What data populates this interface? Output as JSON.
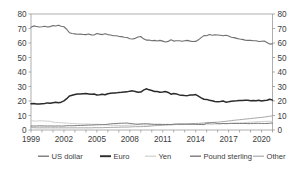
{
  "chart_data": {
    "type": "line",
    "title": "",
    "subtitle": "",
    "xlabel": "",
    "ylabel": "",
    "ylim": [
      0,
      80
    ],
    "yticks": [
      0,
      10,
      20,
      30,
      40,
      50,
      60,
      70,
      80
    ],
    "y2ticks": [
      0,
      10,
      20,
      30,
      40,
      50,
      60,
      70,
      80
    ],
    "xlim": [
      1999,
      2021
    ],
    "xticks": [
      1999,
      2002,
      2005,
      2008,
      2011,
      2014,
      2017,
      2020
    ],
    "xtick_labels": [
      "1999",
      "2002",
      "2005",
      "2008",
      "2011",
      "2014",
      "2017",
      "2020"
    ],
    "grid": false,
    "legend_position": "bottom",
    "dual_axis": true,
    "x": [
      1999.0,
      1999.25,
      1999.5,
      1999.75,
      2000.0,
      2000.25,
      2000.5,
      2000.75,
      2001.0,
      2001.25,
      2001.5,
      2001.75,
      2002.0,
      2002.25,
      2002.5,
      2002.75,
      2003.0,
      2003.25,
      2003.5,
      2003.75,
      2004.0,
      2004.25,
      2004.5,
      2004.75,
      2005.0,
      2005.25,
      2005.5,
      2005.75,
      2006.0,
      2006.25,
      2006.5,
      2006.75,
      2007.0,
      2007.25,
      2007.5,
      2007.75,
      2008.0,
      2008.25,
      2008.5,
      2008.75,
      2009.0,
      2009.25,
      2009.5,
      2009.75,
      2010.0,
      2010.25,
      2010.5,
      2010.75,
      2011.0,
      2011.25,
      2011.5,
      2011.75,
      2012.0,
      2012.25,
      2012.5,
      2012.75,
      2013.0,
      2013.25,
      2013.5,
      2013.75,
      2014.0,
      2014.25,
      2014.5,
      2014.75,
      2015.0,
      2015.25,
      2015.5,
      2015.75,
      2016.0,
      2016.25,
      2016.5,
      2016.75,
      2017.0,
      2017.25,
      2017.5,
      2017.75,
      2018.0,
      2018.25,
      2018.5,
      2018.75,
      2019.0,
      2019.25,
      2019.5,
      2019.75,
      2020.0,
      2020.25,
      2020.5,
      2020.75,
      2021.0
    ],
    "series": [
      {
        "name": "US dollar",
        "color": "#6f6f6f",
        "width": 1.1,
        "values": [
          70.9,
          71.8,
          71.4,
          71.0,
          71.2,
          71.6,
          71.1,
          71.3,
          72.0,
          71.7,
          72.3,
          71.5,
          71.2,
          69.5,
          67.1,
          66.5,
          66.3,
          66.0,
          66.1,
          65.9,
          65.8,
          66.2,
          65.6,
          65.5,
          66.5,
          66.1,
          65.8,
          66.4,
          65.8,
          65.5,
          65.0,
          65.0,
          64.6,
          64.4,
          64.0,
          63.8,
          62.9,
          62.8,
          63.2,
          64.1,
          64.5,
          62.9,
          62.0,
          62.1,
          61.5,
          61.8,
          61.4,
          61.8,
          61.3,
          60.7,
          61.1,
          62.2,
          61.3,
          61.5,
          61.6,
          61.2,
          61.5,
          61.8,
          61.3,
          61.0,
          61.1,
          62.2,
          63.7,
          65.1,
          65.0,
          65.8,
          65.3,
          65.7,
          65.5,
          65.3,
          65.0,
          65.4,
          64.8,
          64.0,
          63.7,
          63.2,
          62.8,
          62.5,
          62.0,
          61.8,
          61.8,
          61.6,
          61.5,
          61.0,
          61.2,
          61.4,
          60.4,
          59.2,
          59.5
        ]
      },
      {
        "name": "Euro",
        "color": "#2b2b2b",
        "width": 1.5,
        "values": [
          18.1,
          18.3,
          18.0,
          17.9,
          18.1,
          18.3,
          18.7,
          18.4,
          18.8,
          19.1,
          18.8,
          19.2,
          20.1,
          21.6,
          23.5,
          24.0,
          24.5,
          24.9,
          24.8,
          25.0,
          25.1,
          24.9,
          24.6,
          24.8,
          24.1,
          24.3,
          24.7,
          24.3,
          25.0,
          25.3,
          25.5,
          25.6,
          25.9,
          26.0,
          26.2,
          26.3,
          26.8,
          27.0,
          26.5,
          26.0,
          26.2,
          27.5,
          28.4,
          27.7,
          27.2,
          26.6,
          26.5,
          26.0,
          26.2,
          26.5,
          25.9,
          24.7,
          25.1,
          24.9,
          24.2,
          24.0,
          23.8,
          23.7,
          24.1,
          24.2,
          24.4,
          23.3,
          22.2,
          21.2,
          21.1,
          20.5,
          20.2,
          19.7,
          19.5,
          19.7,
          20.0,
          19.2,
          19.5,
          19.9,
          20.0,
          20.1,
          20.4,
          20.3,
          20.5,
          20.5,
          20.2,
          20.3,
          20.1,
          20.5,
          20.0,
          20.3,
          20.5,
          21.2,
          20.6
        ]
      },
      {
        "name": "Yen",
        "color": "#cfcfcf",
        "width": 1.0,
        "values": [
          6.4,
          6.3,
          6.1,
          6.4,
          6.3,
          6.2,
          6.1,
          6.0,
          5.5,
          5.2,
          5.1,
          5.0,
          4.9,
          4.8,
          4.6,
          4.5,
          4.4,
          4.3,
          4.2,
          4.1,
          4.2,
          4.1,
          4.0,
          3.9,
          4.0,
          3.9,
          3.8,
          3.7,
          3.4,
          3.3,
          3.2,
          3.2,
          3.1,
          3.0,
          3.0,
          3.2,
          3.3,
          3.4,
          3.5,
          3.7,
          3.6,
          3.5,
          3.4,
          3.5,
          3.6,
          3.7,
          3.8,
          3.9,
          3.8,
          3.9,
          4.0,
          3.6,
          3.8,
          3.9,
          4.0,
          4.1,
          3.9,
          3.8,
          3.7,
          3.8,
          3.8,
          3.9,
          4.0,
          3.9,
          4.0,
          3.9,
          3.8,
          4.1,
          4.2,
          4.4,
          4.5,
          4.2,
          4.4,
          4.6,
          4.8,
          4.9,
          4.8,
          4.9,
          5.0,
          5.2,
          5.4,
          5.5,
          5.6,
          5.7,
          5.8,
          5.9,
          6.0,
          6.0,
          5.9
        ]
      },
      {
        "name": "Pound sterling",
        "color": "#7a7a7a",
        "width": 1.0,
        "values": [
          2.7,
          2.8,
          2.7,
          2.9,
          2.8,
          2.8,
          2.7,
          2.8,
          2.7,
          2.7,
          2.8,
          2.7,
          2.8,
          2.9,
          3.0,
          2.9,
          3.0,
          3.1,
          3.2,
          3.2,
          3.3,
          3.4,
          3.4,
          3.5,
          3.6,
          3.6,
          3.7,
          3.7,
          4.0,
          4.2,
          4.4,
          4.4,
          4.6,
          4.7,
          4.7,
          4.8,
          4.5,
          4.3,
          4.1,
          4.0,
          4.2,
          4.3,
          4.3,
          4.2,
          4.0,
          3.9,
          3.9,
          3.9,
          3.8,
          3.8,
          3.8,
          3.8,
          4.0,
          4.1,
          4.1,
          4.0,
          4.0,
          4.0,
          4.0,
          4.0,
          3.9,
          3.8,
          3.8,
          3.7,
          4.7,
          4.8,
          4.9,
          4.9,
          4.4,
          4.3,
          4.5,
          4.4,
          4.5,
          4.6,
          4.5,
          4.5,
          4.5,
          4.5,
          4.5,
          4.4,
          4.4,
          4.5,
          4.6,
          4.6,
          4.5,
          4.5,
          4.5,
          4.7,
          4.8
        ]
      },
      {
        "name": "Other",
        "color": "#a8a8a8",
        "width": 1.0,
        "values": [
          1.6,
          1.6,
          1.5,
          1.5,
          1.5,
          1.5,
          1.5,
          1.5,
          1.5,
          1.5,
          1.5,
          1.5,
          1.5,
          1.5,
          1.5,
          1.5,
          1.5,
          1.5,
          1.5,
          1.5,
          1.5,
          1.5,
          1.5,
          1.6,
          1.6,
          1.6,
          1.6,
          1.7,
          1.7,
          1.8,
          1.8,
          1.9,
          1.9,
          2.0,
          2.0,
          2.0,
          2.1,
          2.2,
          2.3,
          2.3,
          2.3,
          2.4,
          2.4,
          2.6,
          2.8,
          3.0,
          3.1,
          3.2,
          3.3,
          3.4,
          3.5,
          3.6,
          3.7,
          3.8,
          3.9,
          4.0,
          4.1,
          4.2,
          4.3,
          4.4,
          4.5,
          4.6,
          4.7,
          4.8,
          5.0,
          5.1,
          5.2,
          5.3,
          5.4,
          5.6,
          5.8,
          6.0,
          6.2,
          6.5,
          6.7,
          6.9,
          7.1,
          7.3,
          7.5,
          7.7,
          7.9,
          8.1,
          8.3,
          8.5,
          8.7,
          8.9,
          9.2,
          9.5,
          9.7
        ]
      }
    ],
    "axis": {
      "left_labels": [
        "80",
        "70",
        "60",
        "50",
        "40",
        "30",
        "20",
        "10",
        "0"
      ],
      "right_labels": [
        "80",
        "70",
        "60",
        "50",
        "40",
        "30",
        "20",
        "10",
        "0"
      ]
    }
  },
  "legend": {
    "items": [
      {
        "label": "US dollar",
        "color": "#6f6f6f",
        "width": 1.3
      },
      {
        "label": "Euro",
        "color": "#2b2b2b",
        "width": 1.9
      },
      {
        "label": "Yen",
        "color": "#cfcfcf",
        "width": 1.2
      },
      {
        "label": "Pound sterling",
        "color": "#7a7a7a",
        "width": 1.4
      },
      {
        "label": "Other",
        "color": "#a8a8a8",
        "width": 1.2
      }
    ]
  },
  "colors": {
    "frame": "#8c8c8c",
    "text": "#3c3c3c",
    "background": "#ffffff"
  }
}
